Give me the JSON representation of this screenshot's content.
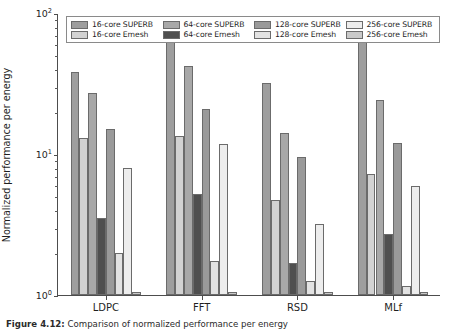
{
  "figure": {
    "caption_prefix": "Figure 4.12:",
    "caption_text": "Comparison of normalized performance per energy"
  },
  "axes": {
    "ylabel": "Normalized performance per energy",
    "ytick_labels": [
      "10",
      "10",
      "10"
    ],
    "ytick_exponents": [
      "0",
      "1",
      "2"
    ],
    "xtick_labels": [
      "LDPC",
      "FFT",
      "RSD",
      "MLf"
    ]
  },
  "legend": {
    "items": [
      {
        "label": "16-core SUPERB",
        "color": "#9e9e9e"
      },
      {
        "label": "64-core SUPERB",
        "color": "#a8a8a8"
      },
      {
        "label": "128-core SUPERB",
        "color": "#9a9a9a"
      },
      {
        "label": "256-core SUPERB",
        "color": "#ededed"
      },
      {
        "label": "16-core Emesh",
        "color": "#d2d2d2"
      },
      {
        "label": "64-core Emesh",
        "color": "#4f4f4f"
      },
      {
        "label": "128-core Emesh",
        "color": "#e2e2e2"
      },
      {
        "label": "256-core Emesh",
        "color": "#c9c9c9"
      }
    ]
  },
  "chart_data": {
    "type": "bar",
    "title": "",
    "xlabel": "",
    "ylabel": "Normalized performance per energy",
    "yscale": "log",
    "ylim": [
      1,
      100
    ],
    "grid": false,
    "legend_position": "upper center",
    "categories": [
      "LDPC",
      "FFT",
      "RSD",
      "MLf"
    ],
    "series": [
      {
        "name": "16-core SUPERB",
        "color": "#9e9e9e",
        "values": [
          38.0,
          68.0,
          32.0,
          73.0
        ]
      },
      {
        "name": "16-core Emesh",
        "color": "#d2d2d2",
        "values": [
          13.0,
          13.5,
          4.7,
          7.2
        ]
      },
      {
        "name": "64-core SUPERB",
        "color": "#a8a8a8",
        "values": [
          27.0,
          42.0,
          14.0,
          24.0
        ]
      },
      {
        "name": "64-core Emesh",
        "color": "#4f4f4f",
        "values": [
          3.5,
          5.2,
          1.7,
          2.7
        ]
      },
      {
        "name": "128-core SUPERB",
        "color": "#9a9a9a",
        "values": [
          15.0,
          21.0,
          9.6,
          12.0
        ]
      },
      {
        "name": "128-core Emesh",
        "color": "#e2e2e2",
        "values": [
          2.0,
          1.75,
          1.25,
          1.15
        ]
      },
      {
        "name": "256-core SUPERB",
        "color": "#ededed",
        "values": [
          8.0,
          11.8,
          3.2,
          5.9
        ]
      },
      {
        "name": "256-core Emesh",
        "color": "#c9c9c9",
        "values": [
          1.05,
          1.05,
          1.05,
          1.05
        ]
      }
    ]
  }
}
